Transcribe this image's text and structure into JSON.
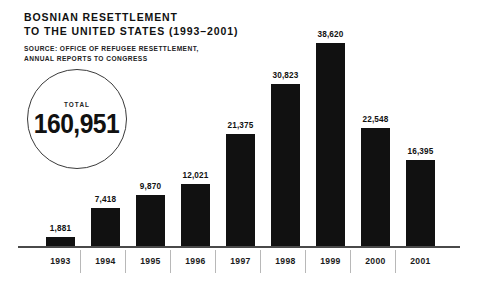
{
  "header": {
    "title_line1": "BOSNIAN RESETTLEMENT",
    "title_line2": "TO THE UNITED STATES (1993–2001)",
    "source_line1": "SOURCE: OFFICE OF REFUGEE RESETTLEMENT,",
    "source_line2": "ANNUAL REPORTS TO CONGRESS"
  },
  "total_badge": {
    "label": "TOTAL",
    "value": "160,951"
  },
  "colors": {
    "bar": "#111111",
    "background": "#ffffff",
    "axis": "#4a4a4a",
    "separator": "#b8b8b8",
    "text": "#111111"
  },
  "chart_data": {
    "type": "bar",
    "subtitle": "SOURCE: OFFICE OF REFUGEE RESETTLEMENT, ANNUAL REPORTS TO CONGRESS",
    "xlabel": "",
    "ylabel": "",
    "ylim": [
      0,
      38620
    ],
    "grid": false,
    "legend": false,
    "total": 160951,
    "categories": [
      "1993",
      "1994",
      "1995",
      "1996",
      "1997",
      "1998",
      "1999",
      "2000",
      "2001"
    ],
    "values": [
      1881,
      7418,
      9870,
      12021,
      21375,
      30823,
      38620,
      22548,
      16395
    ],
    "value_labels": [
      "1,881",
      "7,418",
      "9,870",
      "12,021",
      "21,375",
      "30,823",
      "38,620",
      "22,548",
      "16,395"
    ]
  }
}
